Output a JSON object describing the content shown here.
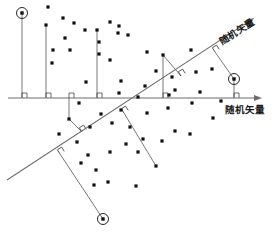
{
  "figure": {
    "background_color": "#ffffff",
    "line_color": "#6d6d6d",
    "dot_color": "#111111",
    "label_color": "#1a1a1a"
  },
  "axes": {
    "horizontal": {
      "label": "随机矢量",
      "label_x": 225,
      "label_y": 113,
      "x1": 8,
      "y1": 98,
      "x2": 262,
      "y2": 98,
      "arrow": "right"
    },
    "diagonal": {
      "label": "随机矢量",
      "label_x": 222,
      "label_y": 45,
      "label_rotation": -32,
      "x1": 7,
      "y1": 180,
      "x2": 254,
      "y2": 18,
      "arrow": "up-right"
    }
  },
  "emphasized_points": [
    {
      "name": "top-left-marker",
      "x": 22,
      "y": 13,
      "r": 5.5
    },
    {
      "name": "right-marker",
      "x": 234,
      "y": 79,
      "r": 5.5
    },
    {
      "name": "bottom-marker",
      "x": 103,
      "y": 219,
      "r": 5.5
    }
  ],
  "projection_lines": [
    {
      "name": "v-line-1",
      "x1": 22,
      "y1": 13,
      "x2": 22,
      "y2": 98
    },
    {
      "name": "v-line-2",
      "x1": 46,
      "y1": 25,
      "x2": 46,
      "y2": 98
    },
    {
      "name": "v-line-3",
      "x1": 97,
      "y1": 30,
      "x2": 97,
      "y2": 98
    },
    {
      "name": "v-line-4",
      "x1": 163,
      "y1": 55,
      "x2": 163,
      "y2": 98
    },
    {
      "name": "v-line-5",
      "x1": 234,
      "y1": 79,
      "x2": 234,
      "y2": 98
    },
    {
      "name": "perp-to-diag-1",
      "x1": 163,
      "y1": 55,
      "x2": 181,
      "y2": 76
    },
    {
      "name": "perp-to-diag-2",
      "x1": 234,
      "y1": 79,
      "x2": 215,
      "y2": 52
    },
    {
      "name": "drop-below-axis-1",
      "x1": 69,
      "y1": 98,
      "x2": 69,
      "y2": 119
    },
    {
      "name": "perp-below-1",
      "x1": 69,
      "y1": 119,
      "x2": 82,
      "y2": 132
    },
    {
      "name": "perp-below-2",
      "x1": 124,
      "y1": 113,
      "x2": 156,
      "y2": 166
    },
    {
      "name": "perp-below-3",
      "x1": 60,
      "y1": 154,
      "x2": 103,
      "y2": 219
    }
  ],
  "right_angle_marks": [
    {
      "name": "ra-axis-1",
      "x": 22,
      "y": 98,
      "rotation": 0
    },
    {
      "name": "ra-axis-2",
      "x": 46,
      "y": 98,
      "rotation": 0
    },
    {
      "name": "ra-axis-3",
      "x": 97,
      "y": 98,
      "rotation": 0
    },
    {
      "name": "ra-axis-4",
      "x": 163,
      "y": 98,
      "rotation": 0
    },
    {
      "name": "ra-axis-5",
      "x": 234,
      "y": 98,
      "rotation": 0
    },
    {
      "name": "ra-axis-6",
      "x": 69,
      "y": 98,
      "rotation": 0
    },
    {
      "name": "ra-diag-1",
      "x": 181,
      "y": 76,
      "rotation": -32
    },
    {
      "name": "ra-diag-2",
      "x": 215,
      "y": 52,
      "rotation": -32
    },
    {
      "name": "ra-diag-3",
      "x": 82,
      "y": 132,
      "rotation": -32
    },
    {
      "name": "ra-diag-4",
      "x": 124,
      "y": 113,
      "rotation": -32
    },
    {
      "name": "ra-diag-5",
      "x": 60,
      "y": 154,
      "rotation": -32
    }
  ],
  "scatter_points": [
    {
      "x": 48,
      "y": 7
    },
    {
      "x": 63,
      "y": 18
    },
    {
      "x": 74,
      "y": 23
    },
    {
      "x": 46,
      "y": 25
    },
    {
      "x": 85,
      "y": 30
    },
    {
      "x": 97,
      "y": 30
    },
    {
      "x": 110,
      "y": 22
    },
    {
      "x": 119,
      "y": 26
    },
    {
      "x": 128,
      "y": 35
    },
    {
      "x": 65,
      "y": 38
    },
    {
      "x": 70,
      "y": 50
    },
    {
      "x": 99,
      "y": 42
    },
    {
      "x": 118,
      "y": 33
    },
    {
      "x": 99,
      "y": 54
    },
    {
      "x": 53,
      "y": 50
    },
    {
      "x": 52,
      "y": 63
    },
    {
      "x": 110,
      "y": 60
    },
    {
      "x": 86,
      "y": 82
    },
    {
      "x": 121,
      "y": 81
    },
    {
      "x": 119,
      "y": 93
    },
    {
      "x": 147,
      "y": 52
    },
    {
      "x": 163,
      "y": 55
    },
    {
      "x": 156,
      "y": 71
    },
    {
      "x": 175,
      "y": 90
    },
    {
      "x": 191,
      "y": 50
    },
    {
      "x": 212,
      "y": 69
    },
    {
      "x": 196,
      "y": 72
    },
    {
      "x": 172,
      "y": 77
    },
    {
      "x": 145,
      "y": 86
    },
    {
      "x": 138,
      "y": 97
    },
    {
      "x": 169,
      "y": 95
    },
    {
      "x": 200,
      "y": 92
    },
    {
      "x": 221,
      "y": 101
    },
    {
      "x": 192,
      "y": 103
    },
    {
      "x": 168,
      "y": 108
    },
    {
      "x": 147,
      "y": 113
    },
    {
      "x": 79,
      "y": 103
    },
    {
      "x": 101,
      "y": 114
    },
    {
      "x": 121,
      "y": 110
    },
    {
      "x": 69,
      "y": 119
    },
    {
      "x": 90,
      "y": 127
    },
    {
      "x": 112,
      "y": 123
    },
    {
      "x": 130,
      "y": 127
    },
    {
      "x": 175,
      "y": 131
    },
    {
      "x": 190,
      "y": 134
    },
    {
      "x": 162,
      "y": 141
    },
    {
      "x": 143,
      "y": 139
    },
    {
      "x": 126,
      "y": 144
    },
    {
      "x": 110,
      "y": 152
    },
    {
      "x": 88,
      "y": 155
    },
    {
      "x": 96,
      "y": 170
    },
    {
      "x": 81,
      "y": 163
    },
    {
      "x": 138,
      "y": 152
    },
    {
      "x": 156,
      "y": 166
    },
    {
      "x": 94,
      "y": 185
    },
    {
      "x": 108,
      "y": 182
    },
    {
      "x": 136,
      "y": 186
    },
    {
      "x": 77,
      "y": 142
    },
    {
      "x": 59,
      "y": 134
    },
    {
      "x": 213,
      "y": 118
    }
  ]
}
